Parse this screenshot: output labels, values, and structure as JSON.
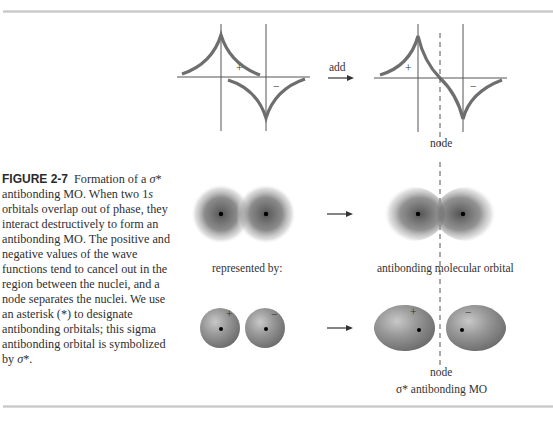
{
  "figure": {
    "label": "FIGURE 2-7",
    "caption_parts": {
      "intro": "Formation of a",
      "sigma": "σ",
      "after_sigma": "* antibonding MO. When two 1",
      "s": "s",
      "rest": " orbitals overlap out of phase, they interact destructively to form an antibonding MO. The positive and negative values of the wave functions tend to cancel out in the region between the nuclei, and a node separates the nuclei. We use an asterisk (*) to designate antibonding orbitals; this sigma antibonding orbital is symbolized by ",
      "sigma_end": "σ",
      "end": "*."
    }
  },
  "wave_plots": {
    "left": {
      "plus_sign": "+",
      "minus_sign": "−"
    },
    "operation_label": "add",
    "right": {
      "plus_sign": "+",
      "minus_sign": "−",
      "node_label": "node"
    }
  },
  "density_row": {
    "left_caption": "represented by:",
    "right_caption": "antibonding molecular orbital"
  },
  "lobe_row": {
    "left_signs": [
      "+",
      "−"
    ],
    "right_signs": [
      "+",
      "−"
    ],
    "node_label": "node",
    "bottom_caption": "σ* antibonding MO"
  },
  "colors": {
    "curve": "#6e6e6e",
    "axis": "#555555",
    "lobe": "#8a8a8a",
    "rule": "#cccccc"
  }
}
